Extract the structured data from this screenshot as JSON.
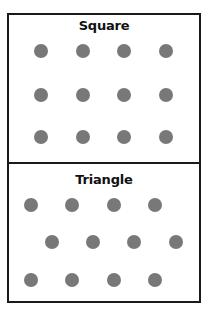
{
  "panels": [
    {
      "title": "Square",
      "arrangement": "square-grid",
      "dot_color": "#787878",
      "dots": [
        {
          "x": 41,
          "y": 51
        },
        {
          "x": 83,
          "y": 51
        },
        {
          "x": 124,
          "y": 51
        },
        {
          "x": 166,
          "y": 51
        },
        {
          "x": 41,
          "y": 95
        },
        {
          "x": 83,
          "y": 95
        },
        {
          "x": 124,
          "y": 95
        },
        {
          "x": 166,
          "y": 95
        },
        {
          "x": 41,
          "y": 137
        },
        {
          "x": 83,
          "y": 137
        },
        {
          "x": 124,
          "y": 137
        },
        {
          "x": 166,
          "y": 137
        }
      ]
    },
    {
      "title": "Triangle",
      "arrangement": "triangular-grid",
      "dot_color": "#787878",
      "dots": [
        {
          "x": 31,
          "y": 205
        },
        {
          "x": 72,
          "y": 205
        },
        {
          "x": 114,
          "y": 205
        },
        {
          "x": 155,
          "y": 205
        },
        {
          "x": 52,
          "y": 242
        },
        {
          "x": 93,
          "y": 242
        },
        {
          "x": 134,
          "y": 242
        },
        {
          "x": 176,
          "y": 242
        },
        {
          "x": 31,
          "y": 280
        },
        {
          "x": 72,
          "y": 280
        },
        {
          "x": 114,
          "y": 280
        },
        {
          "x": 155,
          "y": 280
        }
      ]
    }
  ]
}
